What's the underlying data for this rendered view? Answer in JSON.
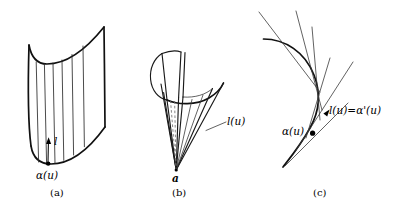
{
  "figure": {
    "background_color": "#ffffff",
    "ink_color": "#111111",
    "panels": [
      {
        "id": "a",
        "caption": "(a)",
        "kind": "cylinder",
        "description": "Ruled surface: generalized cylinder with parallel rulings",
        "labels": {
          "director": "l",
          "base_point": "α(u)"
        }
      },
      {
        "id": "b",
        "caption": "(b)",
        "kind": "cone",
        "description": "Ruled surface: cone with apex a and rulings l(u)",
        "labels": {
          "ruling": "l(u)",
          "apex": "a"
        }
      },
      {
        "id": "c",
        "caption": "(c)",
        "kind": "tangent-developable",
        "description": "Curve with fan of tangent lines; tangent equals derivative",
        "labels": {
          "base_point": "α(u)",
          "tangent_identity_lhs": "l(u)",
          "tangent_identity_eq": "=",
          "tangent_identity_rhs": "α'(u)"
        }
      }
    ]
  }
}
